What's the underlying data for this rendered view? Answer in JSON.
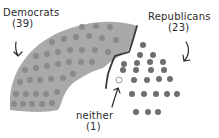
{
  "diagram": {
    "type": "parliament-seat-chart",
    "style": "hand-drawn",
    "colors": {
      "democrats_fill": "#a9a9a9",
      "democrats_dots": "#8a8a8a",
      "republicans_dots": "#6e6e6e",
      "neither_dot_stroke": "#9a9a9a",
      "divider_line": "#3a3a3a",
      "text": "#2a2a2a",
      "background": "#ffffff"
    },
    "groups": [
      {
        "name": "Democrats",
        "count": "(39)",
        "seats": 39
      },
      {
        "name": "Republicans",
        "count": "(23)",
        "seats": 23
      },
      {
        "name": "neither",
        "count": "(1)",
        "seats": 1
      }
    ]
  },
  "labels": {
    "democrats": {
      "name": "Democrats",
      "count": "(39)"
    },
    "republicans": {
      "name": "Republicans",
      "count": "(23)"
    },
    "neither": {
      "name": "neither",
      "count": "(1)"
    }
  }
}
